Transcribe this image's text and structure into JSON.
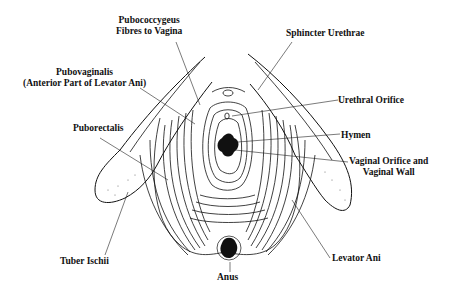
{
  "diagram": {
    "type": "anatomical-line-drawing",
    "labels": {
      "pubococcygeus": {
        "line1": "Pubococcygeus",
        "line2": "Fibres to Vagina"
      },
      "pubovaginalis": {
        "line1": "Pubovaginalis",
        "line2": "(Anterior Part of Levator Ani)"
      },
      "puborectalis": "Puborectalis",
      "tuber_ischii": "Tuber Ischii",
      "anus": "Anus",
      "sphincter_urethrae": "Sphincter Urethrae",
      "urethral_orifice": "Urethral Orifice",
      "hymen": "Hymen",
      "vaginal_orifice": {
        "line1": "Vaginal Orifice and",
        "line2": "Vaginal Wall"
      },
      "levator_ani": "Levator Ani"
    },
    "colors": {
      "ink": "#111111",
      "background": "#ffffff"
    }
  }
}
